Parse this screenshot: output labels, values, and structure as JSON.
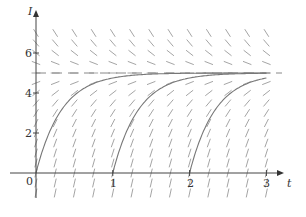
{
  "diagram": {
    "type": "slope_field_with_solutions",
    "equation": "dI/dt = k(5 - I)",
    "x_axis": {
      "label": "t",
      "ticks": [
        "1",
        "2",
        "3"
      ],
      "range": [
        0,
        3
      ]
    },
    "y_axis": {
      "label": "I",
      "ticks": [
        "2",
        "4",
        "6"
      ],
      "range": [
        0,
        7
      ]
    },
    "origin_label": "0",
    "equilibrium": 5,
    "solution_starts": [
      0,
      1,
      2
    ],
    "colors": {
      "field": "#9a9a9a",
      "curve": "#777777",
      "axis": "#444444",
      "equilibrium": "#888888"
    }
  }
}
